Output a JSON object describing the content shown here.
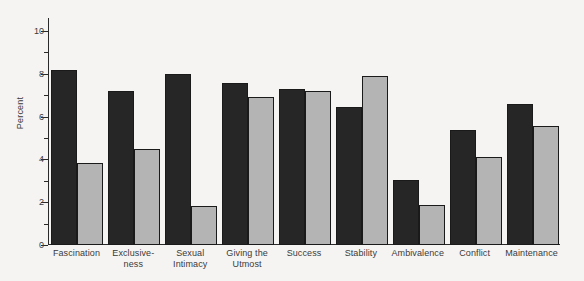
{
  "chart_data": {
    "type": "bar",
    "title": "",
    "subtitle": "",
    "xlabel": "",
    "ylabel": "Percent",
    "ylim": [
      0,
      10.6
    ],
    "yticks_major": [
      0,
      2,
      4,
      6,
      8,
      10
    ],
    "yticks_minor": [
      1,
      3,
      5,
      7,
      9
    ],
    "ytick_labels": [
      "0",
      "2",
      "4",
      "6",
      "8",
      "10"
    ],
    "grid": false,
    "legend": null,
    "categories": [
      "Fascination",
      "Exclusive-\nness",
      "Sexual\nIntimacy",
      "Giving the\nUtmost",
      "Success",
      "Stability",
      "Ambivalence",
      "Conflict",
      "Maintenance"
    ],
    "category_lines": [
      [
        "Fascination",
        ""
      ],
      [
        "Exclusive-",
        "ness"
      ],
      [
        "Sexual",
        "Intimacy"
      ],
      [
        "Giving the",
        "Utmost"
      ],
      [
        "Success",
        ""
      ],
      [
        "Stability",
        ""
      ],
      [
        "Ambivalence",
        ""
      ],
      [
        "Conflict",
        ""
      ],
      [
        "Maintenance",
        ""
      ]
    ],
    "series": [
      {
        "name": "Series 1",
        "color": "#262626",
        "values": [
          8.15,
          7.2,
          8.0,
          7.55,
          7.3,
          6.45,
          3.05,
          5.35,
          6.6
        ]
      },
      {
        "name": "Series 2",
        "color": "#b4b4b4",
        "values": [
          3.85,
          4.5,
          1.8,
          6.9,
          7.2,
          7.9,
          1.85,
          4.1,
          5.55
        ]
      }
    ]
  },
  "colors": {
    "background": "#f6f4f2",
    "axis": "#2a2a2a",
    "text": "#3a3a3a",
    "series_dark": "#262626",
    "series_light": "#b4b4b4",
    "bar_border": "#1a1a1a"
  }
}
